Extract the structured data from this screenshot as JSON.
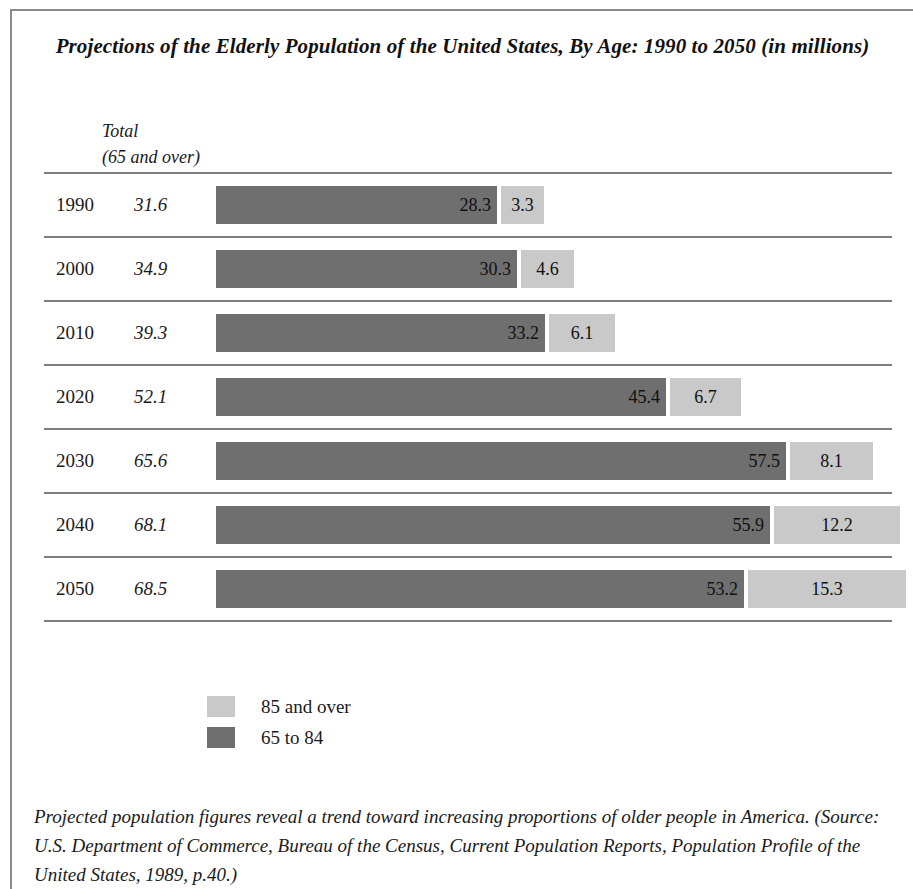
{
  "figure": {
    "title": "Projections of the Elderly Population of the United States, By Age: 1990 to 2050 (in millions)",
    "column_header_line1": "Total",
    "column_header_line2": "(65 and over)",
    "caption": "Projected population figures reveal a trend toward increasing proportions of older people in America. (Source: U.S. Department of Commerce, Bureau of the Census, Current Population Reports, Population Profile of the United States, 1989, p.40.)"
  },
  "legend": {
    "items": [
      {
        "label": "85 and over",
        "color": "#c9c9c9",
        "swatch": "light"
      },
      {
        "label": "65 to 84",
        "color": "#6f6f6f",
        "swatch": "dark"
      }
    ]
  },
  "chart_data": {
    "type": "bar",
    "orientation": "horizontal",
    "stacked": true,
    "title": "Projections of the Elderly Population of the United States, By Age: 1990 to 2050 (in millions)",
    "xlabel": "",
    "ylabel": "",
    "units": "millions",
    "grid": false,
    "legend_position": "bottom-left",
    "categories": [
      "1990",
      "2000",
      "2010",
      "2020",
      "2030",
      "2040",
      "2050"
    ],
    "totals_column_header": "Total (65 and over)",
    "totals": [
      31.6,
      34.9,
      39.3,
      52.1,
      65.6,
      68.1,
      68.5
    ],
    "series": [
      {
        "name": "65 to 84",
        "color": "#6f6f6f",
        "values": [
          28.3,
          30.3,
          33.2,
          45.4,
          57.5,
          55.9,
          53.2
        ]
      },
      {
        "name": "85 and over",
        "color": "#c9c9c9",
        "values": [
          3.3,
          4.6,
          6.1,
          6.7,
          8.1,
          12.2,
          15.3
        ]
      }
    ],
    "xlim": [
      0,
      70
    ],
    "px_per_unit": 9.92
  },
  "rows": [
    {
      "year": "1990",
      "total": "31.6",
      "main": "28.3",
      "old": "3.3",
      "main_w": 281,
      "old_w": 43
    },
    {
      "year": "2000",
      "total": "34.9",
      "main": "30.3",
      "old": "4.6",
      "main_w": 301,
      "old_w": 53
    },
    {
      "year": "2010",
      "total": "39.3",
      "main": "33.2",
      "old": "6.1",
      "main_w": 329,
      "old_w": 66
    },
    {
      "year": "2020",
      "total": "52.1",
      "main": "45.4",
      "old": "6.7",
      "main_w": 450,
      "old_w": 71
    },
    {
      "year": "2030",
      "total": "65.6",
      "main": "57.5",
      "old": "8.1",
      "main_w": 570,
      "old_w": 83
    },
    {
      "year": "2040",
      "total": "68.1",
      "main": "55.9",
      "old": "12.2",
      "main_w": 554,
      "old_w": 126
    },
    {
      "year": "2050",
      "total": "68.5",
      "main": "53.2",
      "old": "15.3",
      "main_w": 528,
      "old_w": 158
    }
  ]
}
